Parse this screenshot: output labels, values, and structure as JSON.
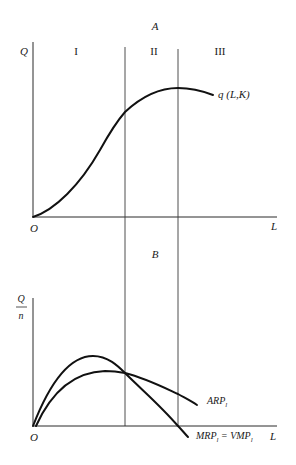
{
  "panel_a": {
    "title": "A",
    "y_axis_label": "Q",
    "x_axis_label": "L",
    "origin_label": "O",
    "stages": [
      "I",
      "II",
      "III"
    ],
    "curve_label": "q (L,K)"
  },
  "panel_b": {
    "title": "B",
    "y_axis_label_numerator": "Q",
    "y_axis_label_denominator": "n",
    "x_axis_label": "L",
    "origin_label": "O",
    "arp_label": "ARP",
    "arp_subscript": "l",
    "mrp_label": "MRP",
    "mrp_subscript": "l",
    "equals": "=",
    "vmp_label": "VMP",
    "vmp_subscript": "l"
  }
}
